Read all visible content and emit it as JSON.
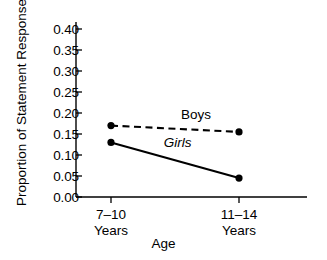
{
  "chart_data": {
    "type": "line",
    "title": "",
    "xlabel": "Age",
    "ylabel": "Proportion of Statement Responses",
    "categories": [
      "7–10 Years",
      "11–14 Years"
    ],
    "x_tick_lines": [
      {
        "line1": "7–10",
        "line2": "Years"
      },
      {
        "line1": "11–14",
        "line2": "Years"
      }
    ],
    "ylim": [
      0.0,
      0.4
    ],
    "y_ticks": [
      "0.00",
      "0.05",
      "0.10",
      "0.15",
      "0.20",
      "0.25",
      "0.30",
      "0.35",
      "0.40"
    ],
    "y_tick_values": [
      0.0,
      0.05,
      0.1,
      0.15,
      0.2,
      0.25,
      0.3,
      0.35,
      0.4
    ],
    "grid": false,
    "legend_position": "inline-labels",
    "series": [
      {
        "name": "Boys",
        "values": [
          0.17,
          0.155
        ],
        "line_style": "dashed",
        "color": "#000000",
        "marker": "filled-circle",
        "label_x": 0.52,
        "label_y": 0.196
      },
      {
        "name": "Girls",
        "values": [
          0.13,
          0.045
        ],
        "line_style": "solid",
        "color": "#000000",
        "marker": "filled-circle",
        "label_x": 0.44,
        "label_y": 0.128,
        "label_italic": true
      }
    ]
  },
  "axis": {
    "line_color": "#000000"
  }
}
